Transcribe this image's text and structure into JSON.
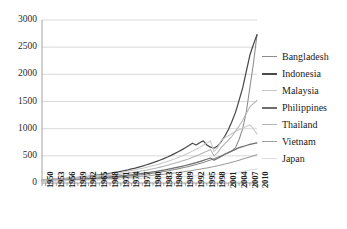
{
  "chart_data": {
    "type": "line",
    "title": "",
    "subtitle": "",
    "xlabel": "",
    "ylabel": "",
    "xlim": [
      1950,
      2010
    ],
    "ylim": [
      0,
      3000
    ],
    "grid": true,
    "legend_position": "right",
    "ytick_labels": [
      "3000",
      "2500",
      "2000",
      "1500",
      "1000",
      "500",
      "0"
    ],
    "yticks": [
      3000,
      2500,
      2000,
      1500,
      1000,
      500,
      0
    ],
    "xtick_labels": [
      "1950",
      "1953",
      "1956",
      "1959",
      "1962",
      "1965",
      "1968",
      "1971",
      "1974",
      "1977",
      "1980",
      "1983",
      "1986",
      "1989",
      "1992",
      "1995",
      "1998",
      "2001",
      "2004",
      "2007",
      "2010"
    ],
    "xticks": [
      1950,
      1953,
      1956,
      1959,
      1962,
      1965,
      1968,
      1971,
      1974,
      1977,
      1980,
      1983,
      1986,
      1989,
      1992,
      1995,
      1998,
      2001,
      2004,
      2007,
      2010
    ],
    "x": [
      1950,
      1951,
      1952,
      1953,
      1954,
      1955,
      1956,
      1957,
      1958,
      1959,
      1960,
      1961,
      1962,
      1963,
      1964,
      1965,
      1966,
      1967,
      1968,
      1969,
      1970,
      1971,
      1972,
      1973,
      1974,
      1975,
      1976,
      1977,
      1978,
      1979,
      1980,
      1981,
      1982,
      1983,
      1984,
      1985,
      1986,
      1987,
      1988,
      1989,
      1990,
      1991,
      1992,
      1993,
      1994,
      1995,
      1996,
      1997,
      1998,
      1999,
      2000,
      2001,
      2002,
      2003,
      2004,
      2005,
      2006,
      2007,
      2008,
      2009,
      2010
    ],
    "series": [
      {
        "name": "Bangladesh",
        "color": "#8c8c8c",
        "values": [
          40,
          42,
          44,
          46,
          48,
          50,
          53,
          55,
          58,
          60,
          63,
          66,
          69,
          72,
          76,
          80,
          84,
          88,
          92,
          97,
          102,
          107,
          113,
          119,
          125,
          132,
          139,
          146,
          154,
          162,
          171,
          180,
          190,
          200,
          211,
          222,
          234,
          247,
          260,
          274,
          289,
          305,
          322,
          340,
          359,
          379,
          400,
          423,
          447,
          472,
          499,
          527,
          557,
          589,
          650,
          800,
          1000,
          1300,
          1750,
          2200,
          2730
        ]
      },
      {
        "name": "Indonesia",
        "color": "#4a4a4a",
        "values": [
          55,
          58,
          62,
          66,
          70,
          75,
          80,
          85,
          90,
          96,
          102,
          109,
          116,
          123,
          131,
          140,
          149,
          158,
          168,
          179,
          190,
          202,
          215,
          229,
          243,
          259,
          275,
          293,
          311,
          331,
          352,
          374,
          398,
          423,
          450,
          478,
          508,
          540,
          574,
          610,
          648,
          689,
          732,
          700,
          740,
          775,
          700,
          660,
          640,
          680,
          760,
          860,
          980,
          1130,
          1300,
          1520,
          1750,
          2050,
          2350,
          2550,
          2730
        ]
      },
      {
        "name": "Malaysia",
        "color": "#c8c8c8",
        "values": [
          60,
          63,
          66,
          70,
          74,
          78,
          82,
          86,
          91,
          96,
          101,
          107,
          113,
          119,
          126,
          133,
          140,
          148,
          156,
          165,
          174,
          184,
          194,
          205,
          217,
          229,
          242,
          256,
          270,
          286,
          302,
          319,
          337,
          356,
          376,
          398,
          420,
          444,
          470,
          496,
          525,
          555,
          587,
          620,
          656,
          694,
          734,
          776,
          580,
          650,
          780,
          830,
          870,
          910,
          950,
          980,
          1010,
          1040,
          1070,
          1000,
          900
        ]
      },
      {
        "name": "Philippines",
        "color": "#6e6e6e",
        "values": [
          45,
          47,
          49,
          51,
          54,
          56,
          59,
          62,
          65,
          68,
          72,
          75,
          79,
          83,
          87,
          92,
          96,
          101,
          106,
          112,
          118,
          124,
          130,
          137,
          144,
          151,
          159,
          167,
          176,
          185,
          194,
          204,
          215,
          226,
          238,
          250,
          263,
          277,
          291,
          306,
          322,
          339,
          357,
          375,
          395,
          415,
          437,
          460,
          420,
          450,
          490,
          530,
          560,
          590,
          620,
          650,
          670,
          690,
          710,
          725,
          740
        ]
      },
      {
        "name": "Thailand",
        "color": "#b4b4b4",
        "values": [
          50,
          53,
          56,
          59,
          62,
          65,
          69,
          73,
          77,
          81,
          85,
          90,
          95,
          100,
          106,
          112,
          118,
          124,
          131,
          138,
          146,
          154,
          162,
          171,
          181,
          191,
          201,
          212,
          224,
          236,
          249,
          263,
          277,
          292,
          308,
          325,
          343,
          362,
          382,
          403,
          425,
          448,
          473,
          499,
          526,
          555,
          585,
          617,
          500,
          560,
          650,
          720,
          790,
          860,
          950,
          1050,
          1150,
          1280,
          1400,
          1460,
          1520
        ]
      },
      {
        "name": "Vietnam",
        "color": "#9e9e9e",
        "values": [
          38,
          39,
          41,
          42,
          44,
          46,
          48,
          50,
          52,
          54,
          56,
          59,
          61,
          64,
          67,
          70,
          73,
          76,
          79,
          83,
          87,
          91,
          95,
          99,
          104,
          108,
          113,
          118,
          124,
          129,
          135,
          141,
          148,
          154,
          161,
          169,
          176,
          185,
          193,
          202,
          211,
          221,
          231,
          242,
          253,
          265,
          277,
          290,
          303,
          318,
          333,
          348,
          365,
          382,
          400,
          420,
          440,
          460,
          480,
          500,
          520
        ]
      },
      {
        "name": "Japan",
        "color": "#dcdcdc",
        "values": [
          35,
          36,
          37,
          38,
          39,
          40,
          42,
          43,
          44,
          46,
          47,
          49,
          50,
          52,
          54,
          55,
          57,
          59,
          61,
          63,
          65,
          67,
          69,
          71,
          74,
          76,
          78,
          81,
          83,
          86,
          89,
          92,
          94,
          97,
          100,
          104,
          107,
          110,
          114,
          118,
          121,
          125,
          129,
          134,
          138,
          142,
          147,
          152,
          157,
          162,
          167,
          173,
          178,
          184,
          190,
          200,
          210,
          225,
          240,
          250,
          260
        ]
      }
    ]
  }
}
